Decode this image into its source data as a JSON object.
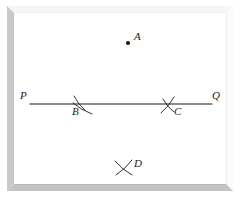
{
  "figure": {
    "background_color": "#ffffff",
    "ink_color": "#1b1b1b",
    "frame": {
      "name": "beveled-picture-frame",
      "outer_color": "#ffffff",
      "bevel_light": "#f2f2f2",
      "bevel_mid": "#c9c9c9",
      "bevel_dark": "#a8a8a8",
      "x": 7,
      "y": 6,
      "width": 226,
      "height": 185,
      "thickness": 7
    },
    "segment": {
      "name": "segment-PQ",
      "x1": 30,
      "y1": 104,
      "x2": 212,
      "y2": 104,
      "stroke_width": 1.1
    },
    "labels": {
      "P": "P",
      "Q": "Q",
      "A": "A",
      "B": "B",
      "C": "C",
      "D": "D"
    },
    "points": [
      {
        "id": "A",
        "label": "A",
        "type": "dot",
        "x": 128,
        "y": 43,
        "r": 2.1,
        "label_x": 134,
        "label_y": 31
      },
      {
        "id": "P",
        "label": "P",
        "type": "endpoint",
        "x": 30,
        "y": 104,
        "label_x": 20,
        "label_y": 90
      },
      {
        "id": "Q",
        "label": "Q",
        "type": "endpoint",
        "x": 212,
        "y": 104,
        "label_x": 212,
        "label_y": 90
      },
      {
        "id": "B",
        "label": "B",
        "type": "arc-intersection",
        "x": 78,
        "y": 104,
        "label_x": 72,
        "label_y": 106
      },
      {
        "id": "C",
        "label": "C",
        "type": "arc-intersection",
        "x": 170,
        "y": 104,
        "label_x": 174,
        "label_y": 106
      },
      {
        "id": "D",
        "label": "D",
        "type": "arc-intersection",
        "x": 124,
        "y": 168,
        "label_x": 134,
        "label_y": 158
      }
    ],
    "arc_marks": [
      {
        "id": "B-arc-1",
        "at": "B",
        "x1": 74,
        "y1": 96,
        "x2": 85,
        "y2": 110,
        "curve": 2.0
      },
      {
        "id": "B-arc-2",
        "at": "B",
        "x1": 73,
        "y1": 103,
        "x2": 92,
        "y2": 114,
        "curve": 2.0
      },
      {
        "id": "C-arc-1",
        "at": "C",
        "x1": 161,
        "y1": 113,
        "x2": 174,
        "y2": 97,
        "curve": 2.0
      },
      {
        "id": "C-arc-2",
        "at": "C",
        "x1": 163,
        "y1": 99,
        "x2": 174,
        "y2": 112,
        "curve": 2.0
      },
      {
        "id": "D-arc-1",
        "at": "D",
        "x1": 115,
        "y1": 161,
        "x2": 132,
        "y2": 175,
        "curve": 2.0
      },
      {
        "id": "D-arc-2",
        "at": "D",
        "x1": 116,
        "y1": 175,
        "x2": 132,
        "y2": 160,
        "curve": 2.0
      }
    ]
  }
}
